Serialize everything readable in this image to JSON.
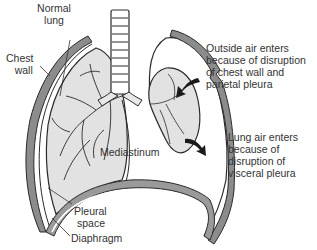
{
  "diagram": {
    "type": "anatomical illustration",
    "colors": {
      "outline": "#2a2a2a",
      "lung_fill": "#e2e2e2",
      "wall_fill": "#8c8c8c",
      "diaphragm_fill": "#9a9a9a",
      "text": "#333333",
      "background": "#ffffff"
    },
    "labels": {
      "normal_lung": [
        "Normal",
        "lung"
      ],
      "chest_wall": [
        "Chest",
        "wall"
      ],
      "outside_air": [
        "Outside air enters",
        "because of disruption",
        "of chest wall and",
        "parietal pleura"
      ],
      "lung_air": [
        "Lung air enters",
        "because of",
        "disruption of",
        "visceral pleura"
      ],
      "mediastinum": "Mediastinum",
      "pleural_space": [
        "Pleural",
        "space"
      ],
      "diaphragm": "Diaphragm"
    },
    "arrows": [
      {
        "name": "outside-air-arrow",
        "direction": "inward toward collapsed lung"
      },
      {
        "name": "lung-air-arrow",
        "direction": "outward into pleural space"
      }
    ]
  }
}
